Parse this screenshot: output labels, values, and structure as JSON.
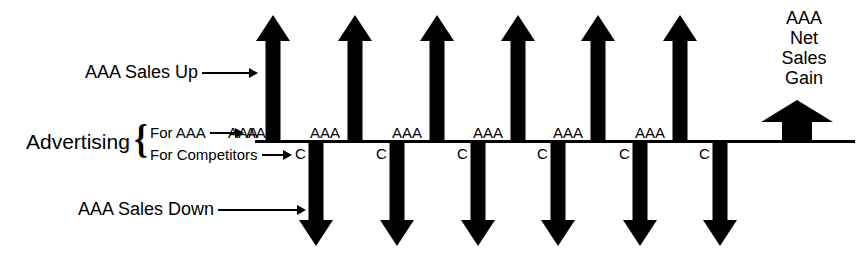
{
  "diagram": {
    "title_text": "",
    "colors": {
      "ink": "#000000",
      "background": "#ffffff"
    },
    "baseline": {
      "x": 255,
      "y": 140,
      "width": 600
    },
    "left_annotations": {
      "advertising_label": "Advertising",
      "brace": "{",
      "for_aaa_label": "For AAA",
      "for_aaa_target": "AAA",
      "for_competitors_label": "For Competitors",
      "sales_up_label": "AAA Sales Up",
      "sales_down_label": "AAA Sales Down"
    },
    "up_columns": [
      {
        "label": "AAA",
        "center_x": 273,
        "label_x": 228
      },
      {
        "label": "AAA",
        "center_x": 355,
        "label_x": 310
      },
      {
        "label": "AAA",
        "center_x": 437,
        "label_x": 392
      },
      {
        "label": "AAA",
        "center_x": 518,
        "label_x": 473
      },
      {
        "label": "AAA",
        "center_x": 598,
        "label_x": 553
      },
      {
        "label": "AAA",
        "center_x": 680,
        "label_x": 635
      }
    ],
    "down_columns": [
      {
        "label": "C",
        "center_x": 316,
        "label_x": 295
      },
      {
        "label": "C",
        "center_x": 397,
        "label_x": 376
      },
      {
        "label": "C",
        "center_x": 478,
        "label_x": 457
      },
      {
        "label": "C",
        "center_x": 558,
        "label_x": 537
      },
      {
        "label": "C",
        "center_x": 640,
        "label_x": 619
      },
      {
        "label": "C",
        "center_x": 720,
        "label_x": 699
      }
    ],
    "net_gain": {
      "label": "AAA\nNet\nSales\nGain",
      "center_x": 797,
      "top_y": 100,
      "height": 42,
      "head_height": 22,
      "shaft_width": 30,
      "head_width": 72
    },
    "up_arrow_geometry": {
      "top_y": 15,
      "bottom_y": 140,
      "shaft_width": 15,
      "head_width": 34,
      "head_height": 26
    },
    "down_arrow_geometry": {
      "top_y": 140,
      "bottom_y": 246,
      "shaft_width": 15,
      "head_width": 34,
      "head_height": 26
    }
  }
}
